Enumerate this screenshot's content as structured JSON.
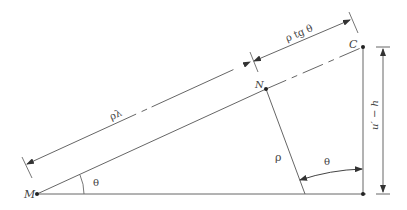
{
  "diagram": {
    "type": "geometric-construction",
    "colors": {
      "line": "#555555",
      "text": "#444444",
      "background": "#ffffff"
    },
    "points": [
      {
        "id": "M",
        "label": "M",
        "x": 37,
        "y": 194
      },
      {
        "id": "N",
        "label": "N",
        "x": 266,
        "y": 89
      },
      {
        "id": "C",
        "label": "C",
        "x": 363,
        "y": 47
      }
    ],
    "labels": {
      "point_M": "M",
      "point_N": "N",
      "point_C": "C",
      "dim_rho_lambda": "ρλ",
      "dim_rho_tg_theta": "ρ tg θ",
      "segment_rho": "ρ",
      "angle_theta_at_M": "θ",
      "angle_theta_at_foot": "θ",
      "dim_vertical": "u′ − h"
    }
  }
}
